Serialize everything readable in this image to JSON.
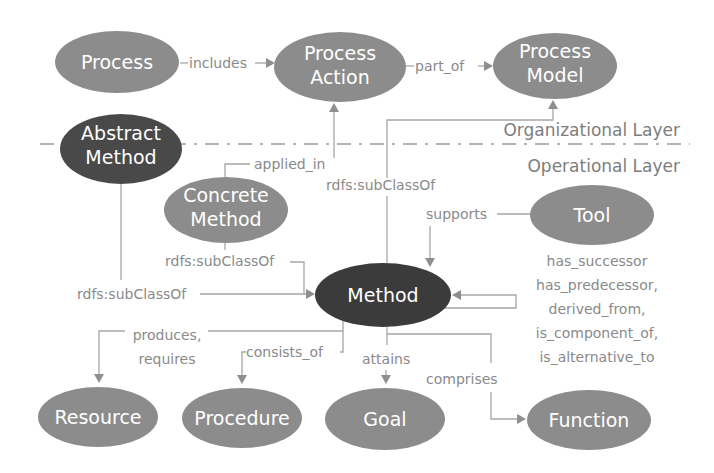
{
  "diagram": {
    "colors": {
      "node_light": "#8c8c8c",
      "node_dark": "#3a3a3a",
      "edge": "#a6a6a6",
      "label_text": "#8a8a8a",
      "node_text": "#ffffff"
    },
    "layers": {
      "upper": "Organizational Layer",
      "lower": "Operational Layer"
    },
    "nodes": {
      "process": {
        "line1": "Process"
      },
      "process_action": {
        "line1": "Process",
        "line2": "Action"
      },
      "process_model": {
        "line1": "Process",
        "line2": "Model"
      },
      "abstract_method": {
        "line1": "Abstract",
        "line2": "Method"
      },
      "concrete_method": {
        "line1": "Concrete",
        "line2": "Method"
      },
      "tool": {
        "line1": "Tool"
      },
      "method": {
        "line1": "Method"
      },
      "resource": {
        "line1": "Resource"
      },
      "procedure": {
        "line1": "Procedure"
      },
      "goal": {
        "line1": "Goal"
      },
      "function": {
        "line1": "Function"
      }
    },
    "edges": {
      "includes": "includes",
      "part_of": "part_of",
      "applied_in": "applied_in",
      "subclass_method_to_model": "rdfs:subClassOf",
      "subclass_concrete": "rdfs:subClassOf",
      "subclass_abstract": "rdfs:subClassOf",
      "supports": "supports",
      "self_relations": [
        "has_successor",
        "has_predecessor,",
        "derived_from,",
        "is_component_of,",
        "is_alternative_to"
      ],
      "produces_requires": [
        "produces,",
        "requires"
      ],
      "consists_of": "consists_of",
      "attains": "attains",
      "comprises": "comprises"
    }
  }
}
